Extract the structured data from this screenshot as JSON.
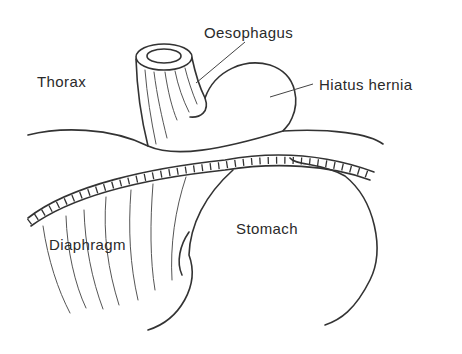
{
  "diagram": {
    "type": "anatomical-illustration",
    "labels": {
      "oesophagus": "Oesophagus",
      "thorax": "Thorax",
      "hiatus_hernia": "Hiatus hernia",
      "diaphragm": "Diaphragm",
      "stomach": "Stomach"
    },
    "line_color": "#333333",
    "text_color": "#2a2a2a",
    "background": "#ffffff"
  }
}
